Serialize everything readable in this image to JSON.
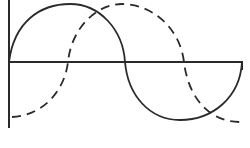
{
  "diagram": {
    "type": "phase-shifted-waves",
    "colors": {
      "background": "#ffffff",
      "stroke": "#2a2a2a"
    },
    "axes": {
      "vertical": {
        "x": 9,
        "y_top": 0,
        "y_bottom": 128
      },
      "horizontal": {
        "y": 62,
        "x_start": 9,
        "x_end": 242,
        "end_tick_bottom": 70
      }
    },
    "waves": [
      {
        "name": "solid-wave",
        "style": "solid",
        "points": [
          [
            9,
            62
          ],
          [
            70,
            4
          ],
          [
            125,
            62
          ],
          [
            180,
            120
          ],
          [
            242,
            62
          ]
        ]
      },
      {
        "name": "dashed-wave",
        "style": "dashed",
        "points": [
          [
            12,
            117
          ],
          [
            68,
            62
          ],
          [
            122,
            4
          ],
          [
            184,
            62
          ],
          [
            240,
            122
          ]
        ]
      }
    ]
  }
}
